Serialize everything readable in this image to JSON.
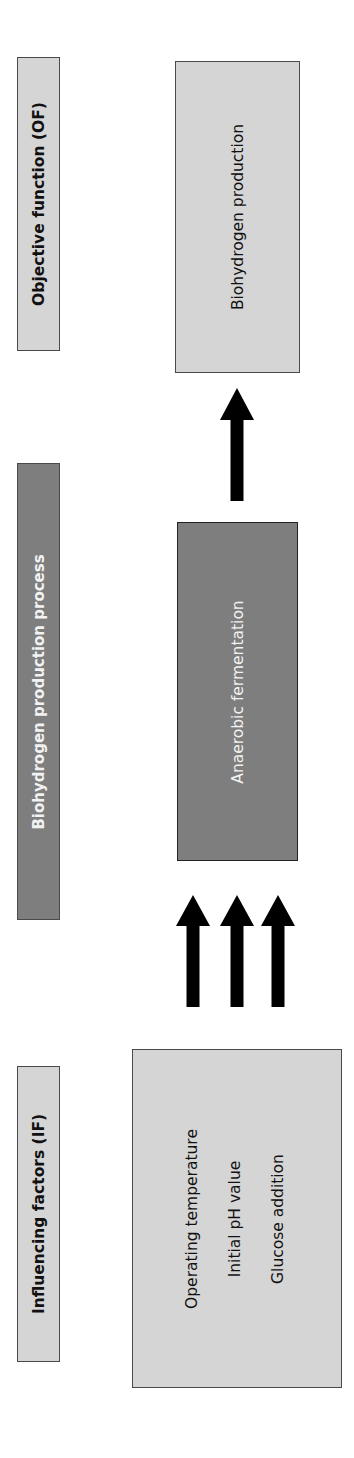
{
  "diagram": {
    "orientation": "rotated -90deg (text reads bottom-to-top)",
    "colors": {
      "light_box": "#d5d5d5",
      "dark_box": "#7e7e7e",
      "border": "#4a4a4a",
      "arrow": "#000000",
      "dark_text": "#111111",
      "light_text": "#f2f2f2"
    },
    "headers": {
      "influencing_factors": "Influencing factors (IF)",
      "process": "Biohydrogen production process",
      "objective_function": "Objective function (OF)"
    },
    "factors": {
      "items": [
        "Operating temperature",
        "Initial pH value",
        "Glucose addition"
      ]
    },
    "process_box": {
      "label": "Anaerobic fermentation"
    },
    "output_box": {
      "label": "Biohydrogen production"
    },
    "arrows": {
      "inputs_count": 3,
      "output_count": 1
    }
  }
}
